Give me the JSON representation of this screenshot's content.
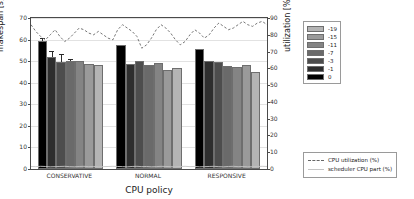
{
  "chart_data": {
    "type": "bar",
    "title": "",
    "xlabel": "CPU policy",
    "ylabel": "makespan [s]",
    "ylabel_secondary": "utilization [%]",
    "ylim": [
      0,
      70
    ],
    "ylim_secondary": [
      0,
      90
    ],
    "yticks": [
      0,
      10,
      20,
      30,
      40,
      50,
      60,
      70
    ],
    "yticks_secondary": [
      0,
      10,
      20,
      30,
      40,
      50,
      60,
      70,
      80,
      90
    ],
    "grid": true,
    "categories": [
      "CONSERVATIVE",
      "NORMAL",
      "RESPONSIVE"
    ],
    "bar_legend_title": "",
    "series": [
      {
        "name": "-19",
        "color": "#b4b4b4",
        "values": [
          48.3,
          46.7,
          45.0
        ],
        "errors": [
          0.0,
          0.0,
          0.0
        ]
      },
      {
        "name": "-15",
        "color": "#9a9a9a",
        "values": [
          48.8,
          45.9,
          48.0
        ],
        "errors": [
          0.0,
          0.0,
          0.0
        ]
      },
      {
        "name": "-11",
        "color": "#848484",
        "values": [
          50.0,
          49.0,
          47.5
        ],
        "errors": [
          0.0,
          0.0,
          0.0
        ]
      },
      {
        "name": "-7",
        "color": "#6a6a6a",
        "values": [
          50.2,
          48.4,
          47.9
        ],
        "errors": [
          0.8,
          0.0,
          0.0
        ]
      },
      {
        "name": "-3",
        "color": "#4d4d4d",
        "values": [
          49.5,
          50.3,
          49.4
        ],
        "errors": [
          4.0,
          0.0,
          0.0
        ]
      },
      {
        "name": "-1",
        "color": "#2e2e2e",
        "values": [
          52.0,
          48.5,
          50.0
        ],
        "errors": [
          2.6,
          0.0,
          0.0
        ]
      },
      {
        "name": "0",
        "color": "#000000",
        "values": [
          59.5,
          57.3,
          55.8
        ],
        "errors": [
          1.4,
          0.0,
          0.0
        ]
      }
    ],
    "bar_order_left_to_right": [
      "0",
      "-1",
      "-3",
      "-7",
      "-11",
      "-15",
      "-19"
    ],
    "lines": [
      {
        "name": "CPU utilization (%)",
        "style": "dashed",
        "color": "#666666",
        "axis": "secondary",
        "values": [
          86,
          82,
          79,
          77,
          80,
          83,
          79,
          76,
          78,
          81,
          84,
          83,
          81,
          80,
          82,
          80,
          78,
          77,
          83,
          86,
          84,
          82,
          79,
          72,
          74,
          78,
          83,
          86,
          84,
          81,
          77,
          74,
          76,
          80,
          83,
          81,
          78,
          80,
          84,
          87,
          85,
          83,
          84,
          86,
          88,
          86,
          85,
          87,
          88,
          86
        ]
      },
      {
        "name": "scheduler CPU part (%)",
        "style": "solid",
        "color": "#c4c4c4",
        "axis": "secondary",
        "values": [
          1.5,
          1.4,
          1.6,
          1.5,
          1.3,
          1.4,
          1.5,
          1.6,
          1.4,
          1.3,
          1.5,
          1.6,
          1.4,
          1.5,
          1.3,
          1.4,
          1.5,
          1.6,
          1.5,
          1.4,
          1.3,
          1.5,
          1.6,
          1.4,
          1.5,
          1.3,
          1.4,
          1.6,
          1.5,
          1.4,
          1.3,
          1.5,
          1.6,
          1.4,
          1.5,
          1.3,
          1.4,
          1.5,
          1.6,
          1.4,
          1.3,
          1.5,
          1.6,
          1.4,
          1.5,
          1.3,
          1.4,
          1.5,
          1.6,
          1.5
        ]
      }
    ]
  },
  "swatch_legend": {
    "items": [
      {
        "label": "-19",
        "color": "#b4b4b4"
      },
      {
        "label": "-15",
        "color": "#9a9a9a"
      },
      {
        "label": "-11",
        "color": "#848484"
      },
      {
        "label": "-7",
        "color": "#6a6a6a"
      },
      {
        "label": "-3",
        "color": "#4d4d4d"
      },
      {
        "label": "-1",
        "color": "#2e2e2e"
      },
      {
        "label": "0",
        "color": "#000000"
      }
    ]
  },
  "line_legend": {
    "items": [
      {
        "label": "CPU utilization (%)",
        "style": "dashed"
      },
      {
        "label": "scheduler CPU part (%)",
        "style": "solid"
      }
    ]
  }
}
